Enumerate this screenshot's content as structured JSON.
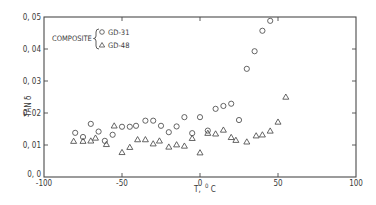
{
  "chart_data": {
    "type": "scatter",
    "title": "",
    "xlabel": "T, °C",
    "xlabel_main": "T,",
    "xlabel_unit_sup": "0",
    "xlabel_unit": "C",
    "ylabel": "TAN δ",
    "xlim": [
      -100,
      100
    ],
    "ylim": [
      0.0,
      0.05
    ],
    "grid": false,
    "x_ticks": [
      -100,
      -50,
      0,
      50,
      100
    ],
    "x_tick_labels": [
      "-100",
      "-50",
      "0",
      "50",
      "100"
    ],
    "y_ticks": [
      0.0,
      0.01,
      0.02,
      0.03,
      0.04,
      0.05
    ],
    "y_tick_labels": [
      "0, 0",
      "0, 01",
      "0, 02",
      "0, 03",
      "0, 04",
      "0, 05"
    ],
    "legend": {
      "position": "upper-left",
      "group_label": "COMPOSITE",
      "entries": [
        {
          "label": "GD-31",
          "marker": "circle"
        },
        {
          "label": "GD-48",
          "marker": "triangle"
        }
      ]
    },
    "series": [
      {
        "name": "GD-31",
        "marker": "circle",
        "x": [
          -80,
          -75,
          -70,
          -65,
          -61,
          -56,
          -50,
          -45,
          -41,
          -35,
          -30,
          -25,
          -20,
          -15,
          -10,
          -5,
          0,
          5,
          10,
          15,
          20,
          25,
          30,
          35,
          40,
          45
        ],
        "y": [
          0.0138,
          0.0125,
          0.0166,
          0.0142,
          0.0113,
          0.0132,
          0.0157,
          0.0157,
          0.016,
          0.0176,
          0.0176,
          0.016,
          0.014,
          0.0158,
          0.0187,
          0.0137,
          0.0187,
          0.0145,
          0.0213,
          0.0222,
          0.0229,
          0.0178,
          0.0338,
          0.0393,
          0.0457,
          0.0488
        ]
      },
      {
        "name": "GD-48",
        "marker": "triangle",
        "x": [
          -81,
          -75,
          -70,
          -67,
          -60,
          -55,
          -50,
          -45,
          -40,
          -35,
          -30,
          -26,
          -20,
          -15,
          -10,
          -5,
          0,
          5,
          10,
          15,
          20,
          23,
          30,
          36,
          40,
          45,
          50,
          55
        ],
        "y": [
          0.0112,
          0.0112,
          0.0113,
          0.0122,
          0.0102,
          0.016,
          0.0077,
          0.0093,
          0.0117,
          0.0117,
          0.0104,
          0.0113,
          0.0094,
          0.0101,
          0.0097,
          0.0121,
          0.0076,
          0.0137,
          0.0135,
          0.0147,
          0.0124,
          0.0115,
          0.011,
          0.0129,
          0.0132,
          0.0144,
          0.0172,
          0.025
        ]
      }
    ]
  },
  "style": {
    "ink_color": "#4a4a4a",
    "background": "#ffffff"
  }
}
